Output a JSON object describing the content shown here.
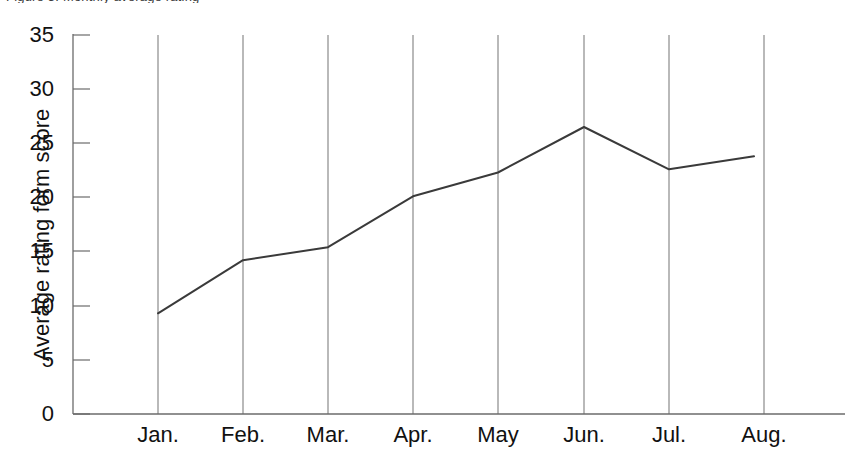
{
  "caption": {
    "cut_off_text": "Figure 3. Monthly average rating",
    "rule_visible": true
  },
  "chart_data": {
    "type": "line",
    "title": "",
    "xlabel": "",
    "ylabel": "Average rating form score",
    "categories": [
      "Jan.",
      "Feb.",
      "Mar.",
      "Apr.",
      "May",
      "Jun.",
      "Jul.",
      "Aug."
    ],
    "values": [
      9.3,
      14.2,
      15.4,
      20.1,
      22.3,
      26.5,
      22.6,
      23.8
    ],
    "ylim": [
      0,
      35
    ],
    "yticks": [
      0,
      5,
      10,
      15,
      20,
      25,
      30,
      35
    ],
    "ytick_labels": [
      "0",
      "5",
      "10",
      "15",
      "20",
      "25",
      "30",
      "35"
    ],
    "grid": "vertical-only",
    "legend": "none",
    "line_color": "#3a3a3a",
    "axis_color": "#6b6b6b",
    "gridline_color": "#8a8a8a",
    "markers": false
  }
}
